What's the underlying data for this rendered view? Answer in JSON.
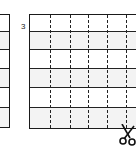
{
  "diagram": {
    "row_label": "3",
    "icon": "scissors-icon",
    "colors": {
      "line": "#1a1a1a",
      "alt_row": "#f3f3f3",
      "background": "#ffffff"
    }
  }
}
